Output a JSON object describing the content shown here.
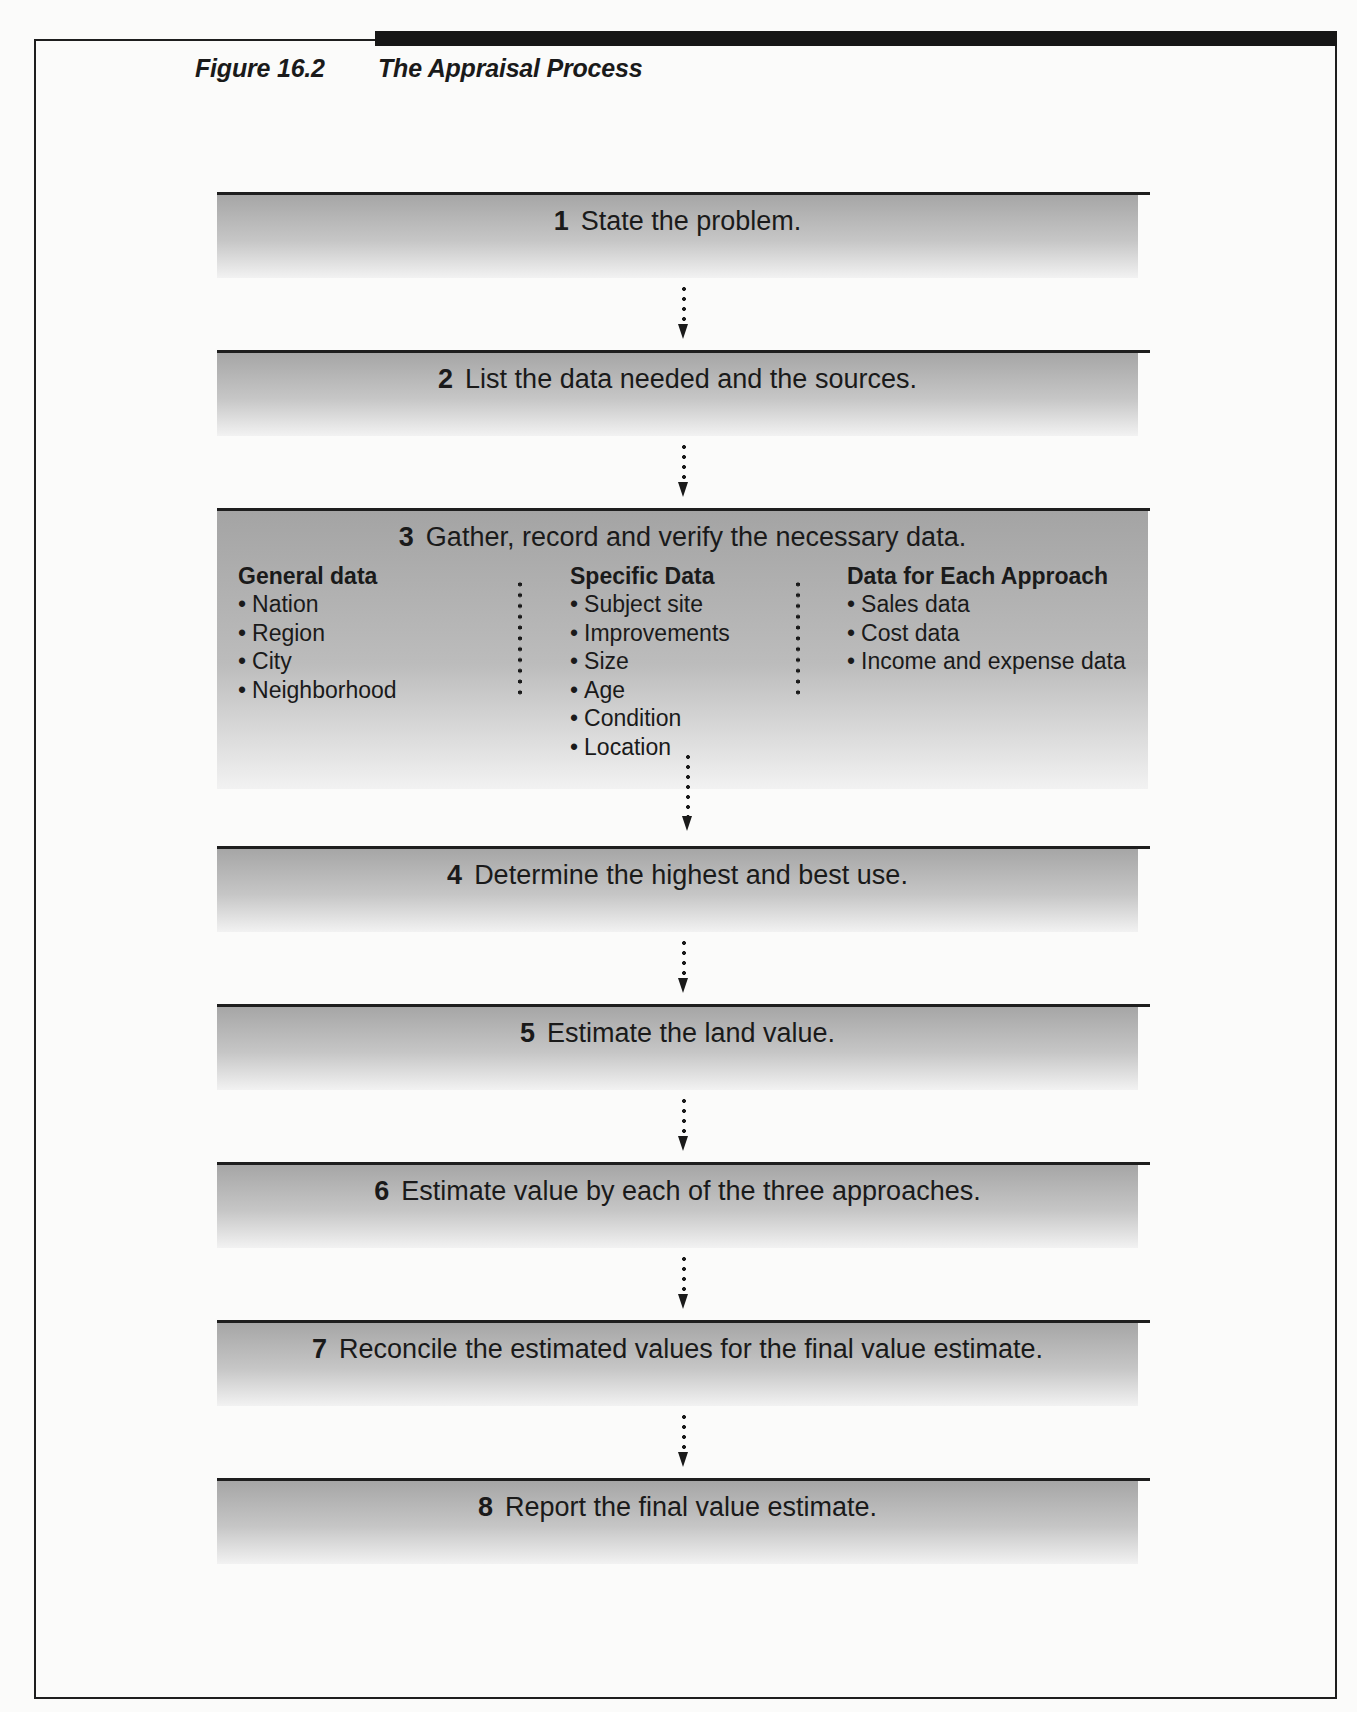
{
  "figure": {
    "number": "Figure 16.2",
    "title": "The Appraisal Process"
  },
  "steps": [
    {
      "n": "1",
      "text": "State the problem."
    },
    {
      "n": "2",
      "text": "List the data needed and the sources."
    },
    {
      "n": "3",
      "text": "Gather, record and verify the necessary data."
    },
    {
      "n": "4",
      "text": "Determine the highest and best use."
    },
    {
      "n": "5",
      "text": "Estimate the land value."
    },
    {
      "n": "6",
      "text": "Estimate value by each of the three approaches."
    },
    {
      "n": "7",
      "text": "Reconcile the estimated values for the final value estimate."
    },
    {
      "n": "8",
      "text": "Report the final value estimate."
    }
  ],
  "step3_columns": [
    {
      "heading": "General data",
      "items": [
        "Nation",
        "Region",
        "City",
        "Neighborhood"
      ]
    },
    {
      "heading": "Specific Data",
      "items": [
        "Subject site",
        "Improvements",
        "Size",
        "Age",
        "Condition",
        "Location"
      ]
    },
    {
      "heading": "Data for Each Approach",
      "items": [
        "Sales data",
        "Cost data",
        "Income and expense data"
      ]
    }
  ],
  "colors": {
    "line": "#1e1e1e",
    "shade_top": "#a6a6a6",
    "shade_bottom": "#f2f2f2"
  }
}
